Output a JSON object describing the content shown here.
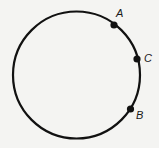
{
  "diagram": {
    "type": "circle-with-points",
    "stroke_color": "#111111",
    "background": "#f4f4f2",
    "circle": {
      "cx": 76.5,
      "cy": 75,
      "r": 63.5,
      "stroke_width": 2.2
    },
    "points": [
      {
        "name": "A",
        "label": "A",
        "x": 114,
        "y": 25,
        "label_x": 116,
        "label_y": 17
      },
      {
        "name": "C",
        "label": "C",
        "x": 137,
        "y": 59,
        "label_x": 144,
        "label_y": 62
      },
      {
        "name": "B",
        "label": "B",
        "x": 130.5,
        "y": 109,
        "label_x": 136,
        "label_y": 119
      }
    ]
  }
}
